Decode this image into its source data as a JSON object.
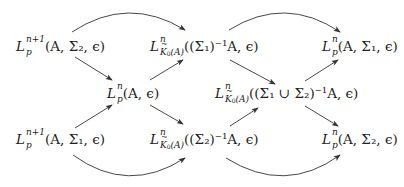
{
  "diagram": {
    "type": "commutative-diagram",
    "nodes": {
      "top_left": {
        "base": "L",
        "sup": "n+1",
        "sub": "p",
        "args": "(A, Σ2, ε)",
        "sigma_index": "2"
      },
      "top_mid": {
        "base": "L",
        "sup": "n",
        "sub": "K̃0(A)",
        "args": "((Σ1)⁻¹A, ε)"
      },
      "top_right": {
        "base": "L",
        "sup": "n",
        "sub": "p",
        "args": "(A, Σ1, ε)"
      },
      "mid_left": {
        "base": "L",
        "sup": "n",
        "sub": "p",
        "args": "(A, ε)"
      },
      "mid_right": {
        "base": "L",
        "sup": "n",
        "sub": "K̃0(A)",
        "args": "((Σ1 ∪ Σ2)⁻¹A, ε)"
      },
      "bottom_left": {
        "base": "L",
        "sup": "n+1",
        "sub": "p",
        "args": "(A, Σ1, ε)"
      },
      "bottom_mid": {
        "base": "L",
        "sup": "n",
        "sub": "K̃0(A)",
        "args": "((Σ2)⁻¹A, ε)"
      },
      "bottom_right": {
        "base": "L",
        "sup": "n",
        "sub": "p",
        "args": "(A, Σ2, ε)"
      }
    },
    "labels": {
      "L": "L",
      "sup_n1": "n+1",
      "sup_n": "n",
      "sub_p": "p",
      "K": "K",
      "zero": "0",
      "A_paren": "(A)",
      "tl_args": "(A, Σ₂, ϵ)",
      "tm_args": "((Σ₁)⁻¹A, ϵ)",
      "tr_args": "(A, Σ₁, ϵ)",
      "ml_args": "(A, ϵ)",
      "mr_args": "((Σ₁ ∪ Σ₂)⁻¹A, ϵ)",
      "bl_args": "(A, Σ₁, ϵ)",
      "bm_args": "((Σ₂)⁻¹A, ϵ)",
      "br_args": "(A, Σ₂, ϵ)"
    },
    "arrows": [
      {
        "from": "top_left",
        "to": "top_mid",
        "shape": "curved"
      },
      {
        "from": "top_mid",
        "to": "top_right",
        "shape": "curved"
      },
      {
        "from": "top_left",
        "to": "mid_left",
        "shape": "straight"
      },
      {
        "from": "mid_left",
        "to": "top_mid",
        "shape": "straight"
      },
      {
        "from": "top_mid",
        "to": "mid_right",
        "shape": "straight"
      },
      {
        "from": "mid_right",
        "to": "top_right",
        "shape": "straight"
      },
      {
        "from": "bottom_left",
        "to": "mid_left",
        "shape": "straight"
      },
      {
        "from": "mid_left",
        "to": "bottom_mid",
        "shape": "straight"
      },
      {
        "from": "bottom_mid",
        "to": "mid_right",
        "shape": "straight"
      },
      {
        "from": "mid_right",
        "to": "bottom_right",
        "shape": "straight"
      },
      {
        "from": "bottom_left",
        "to": "bottom_mid",
        "shape": "curved"
      },
      {
        "from": "bottom_mid",
        "to": "bottom_right",
        "shape": "curved"
      }
    ],
    "colors": {
      "stroke": "#333333",
      "text": "#222222",
      "background": "#ffffff"
    }
  }
}
